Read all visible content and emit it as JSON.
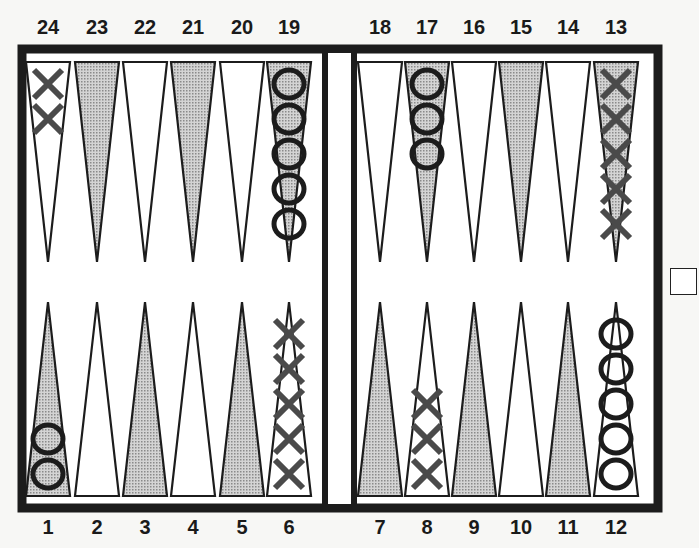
{
  "board": {
    "title": "",
    "top_numbers": [
      "24",
      "23",
      "22",
      "21",
      "20",
      "19",
      "18",
      "17",
      "16",
      "15",
      "14",
      "13"
    ],
    "bottom_numbers": [
      "1",
      "2",
      "3",
      "4",
      "5",
      "6",
      "7",
      "8",
      "9",
      "10",
      "11",
      "12"
    ],
    "colors": {
      "frame": "#1c1c1c",
      "shaded_point": "#b8b8b8",
      "light_point": "#ffffff",
      "x_checker": "#4a4a4a",
      "o_checker": "#1c1c1c",
      "background": "#f7f7f5"
    },
    "points": [
      {
        "point": 1,
        "shaded": true,
        "checker": "O",
        "count": 2
      },
      {
        "point": 2,
        "shaded": false,
        "checker": "",
        "count": 0
      },
      {
        "point": 3,
        "shaded": true,
        "checker": "",
        "count": 0
      },
      {
        "point": 4,
        "shaded": false,
        "checker": "",
        "count": 0
      },
      {
        "point": 5,
        "shaded": true,
        "checker": "",
        "count": 0
      },
      {
        "point": 6,
        "shaded": false,
        "checker": "X",
        "count": 5
      },
      {
        "point": 7,
        "shaded": true,
        "checker": "",
        "count": 0
      },
      {
        "point": 8,
        "shaded": false,
        "checker": "X",
        "count": 3
      },
      {
        "point": 9,
        "shaded": true,
        "checker": "",
        "count": 0
      },
      {
        "point": 10,
        "shaded": false,
        "checker": "",
        "count": 0
      },
      {
        "point": 11,
        "shaded": true,
        "checker": "",
        "count": 0
      },
      {
        "point": 12,
        "shaded": false,
        "checker": "O",
        "count": 5
      },
      {
        "point": 13,
        "shaded": true,
        "checker": "X",
        "count": 5
      },
      {
        "point": 14,
        "shaded": false,
        "checker": "",
        "count": 0
      },
      {
        "point": 15,
        "shaded": true,
        "checker": "",
        "count": 0
      },
      {
        "point": 16,
        "shaded": false,
        "checker": "",
        "count": 0
      },
      {
        "point": 17,
        "shaded": true,
        "checker": "O",
        "count": 3
      },
      {
        "point": 18,
        "shaded": false,
        "checker": "",
        "count": 0
      },
      {
        "point": 19,
        "shaded": true,
        "checker": "O",
        "count": 5
      },
      {
        "point": 20,
        "shaded": false,
        "checker": "",
        "count": 0
      },
      {
        "point": 21,
        "shaded": true,
        "checker": "",
        "count": 0
      },
      {
        "point": 22,
        "shaded": false,
        "checker": "",
        "count": 0
      },
      {
        "point": 23,
        "shaded": true,
        "checker": "",
        "count": 0
      },
      {
        "point": 24,
        "shaded": false,
        "checker": "X",
        "count": 2
      }
    ],
    "doubling_cube": {
      "value": "",
      "position": "right-middle"
    }
  }
}
